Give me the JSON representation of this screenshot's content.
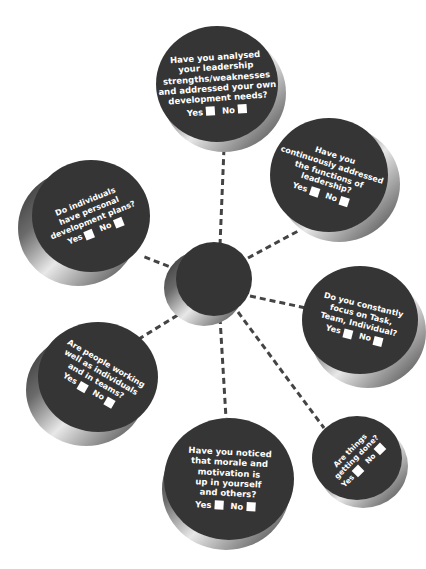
{
  "diagram": {
    "center": {
      "label": ""
    },
    "connector_style": "dashed",
    "colors": {
      "disc_face": "#353535",
      "text": "#ffffff",
      "checkbox": "#ffffff",
      "connector": "#444444",
      "background": "#ffffff"
    },
    "nodes": [
      {
        "id": "top",
        "question": "Have you analysed\nyour leadership\nstrengths/weaknesses\nand addressed your own\ndevelopment needs?",
        "yes_label": "Yes",
        "no_label": "No"
      },
      {
        "id": "upper-right",
        "question": "Have you\ncontinuously addressed\nthe functions of\nleadership?",
        "yes_label": "Yes",
        "no_label": "No"
      },
      {
        "id": "upper-left",
        "question": "Do individuals\nhave personal\ndevelopment plans?",
        "yes_label": "Yes",
        "no_label": "No"
      },
      {
        "id": "right",
        "question": "Do you constantly\nfocus on Task,\nTeam, Individual?",
        "yes_label": "Yes",
        "no_label": "No"
      },
      {
        "id": "lower-left",
        "question": "Are people working\nwell as individuals\nand in teams?",
        "yes_label": "Yes",
        "no_label": "No"
      },
      {
        "id": "bottom",
        "question": "Have you noticed\nthat morale and\nmotivation is\nup in yourself\nand others?",
        "yes_label": "Yes",
        "no_label": "No"
      },
      {
        "id": "lower-right",
        "question": "Are things\ngetting done?",
        "yes_label": "Yes",
        "no_label": "No"
      }
    ]
  }
}
